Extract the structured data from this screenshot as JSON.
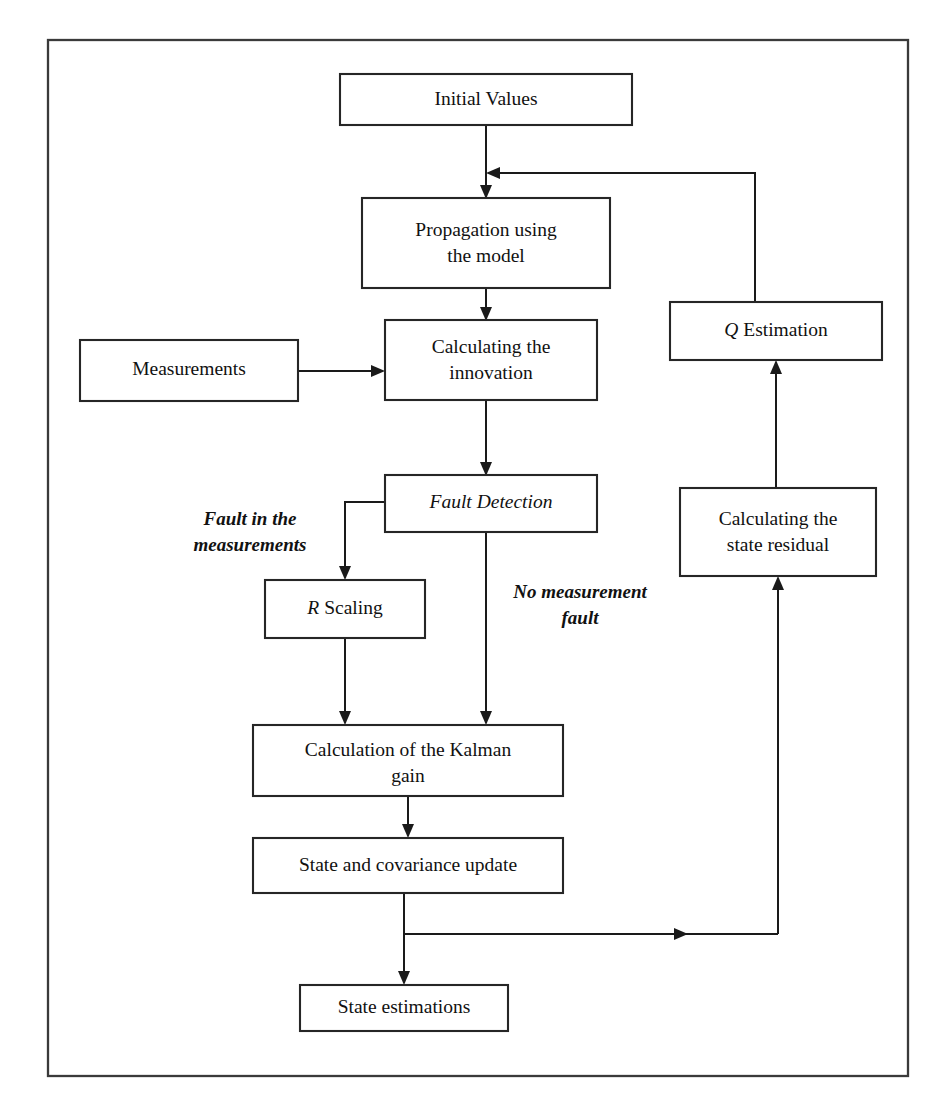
{
  "diagram": {
    "frame": {
      "x": 48,
      "y": 40,
      "width": 860,
      "height": 1036
    },
    "colors": {
      "box_stroke": "#262626",
      "box_fill": "#ffffff",
      "edge": "#1a1a1a",
      "text": "#111111",
      "frame": "#3a3a3a",
      "background": "#ffffff"
    },
    "nodes": [
      {
        "id": "initial-values",
        "label": "Initial Values",
        "lines": [
          "Initial Values"
        ],
        "x": 340,
        "y": 74,
        "width": 292,
        "height": 51
      },
      {
        "id": "propagation",
        "label": "Propagation using the model",
        "lines": [
          "Propagation using",
          "the model"
        ],
        "x": 362,
        "y": 198,
        "width": 248,
        "height": 90
      },
      {
        "id": "measurements",
        "label": "Measurements",
        "lines": [
          "Measurements"
        ],
        "x": 80,
        "y": 340,
        "width": 218,
        "height": 61
      },
      {
        "id": "calculating-innovation",
        "label": "Calculating the innovation",
        "lines": [
          "Calculating the",
          "innovation"
        ],
        "x": 385,
        "y": 320,
        "width": 212,
        "height": 80
      },
      {
        "id": "fault-detection",
        "label": "Fault Detection",
        "lines": [
          "Fault Detection"
        ],
        "italic": true,
        "x": 385,
        "y": 475,
        "width": 212,
        "height": 57
      },
      {
        "id": "r-scaling",
        "label": "R Scaling",
        "lines": [
          "R Scaling"
        ],
        "italic_lead": "R",
        "x": 265,
        "y": 580,
        "width": 160,
        "height": 58
      },
      {
        "id": "kalman-gain",
        "label": "Calculation of the Kalman gain",
        "lines": [
          "Calculation of the Kalman",
          "gain"
        ],
        "x": 253,
        "y": 725,
        "width": 310,
        "height": 71
      },
      {
        "id": "state-covariance-update",
        "label": "State and covariance update",
        "lines": [
          "State and covariance update"
        ],
        "x": 253,
        "y": 838,
        "width": 310,
        "height": 55
      },
      {
        "id": "state-estimations",
        "label": "State estimations",
        "lines": [
          "State estimations"
        ],
        "x": 300,
        "y": 985,
        "width": 208,
        "height": 46
      },
      {
        "id": "q-estimation",
        "label": "Q Estimation",
        "lines": [
          "Q Estimation"
        ],
        "italic_lead": "Q",
        "x": 670,
        "y": 302,
        "width": 212,
        "height": 58
      },
      {
        "id": "calculating-state-residual",
        "label": "Calculating the state residual",
        "lines": [
          "Calculating the",
          "state residual"
        ],
        "x": 680,
        "y": 488,
        "width": 196,
        "height": 88
      }
    ],
    "edge_labels": [
      {
        "id": "fault-in-measurements",
        "lines": [
          "Fault in the",
          "measurements"
        ],
        "x": 250,
        "y": 518
      },
      {
        "id": "no-measurement-fault",
        "lines": [
          "No measurement",
          "fault"
        ],
        "x": 580,
        "y": 592
      }
    ],
    "edges": [
      {
        "id": "initial-to-propagation",
        "from": "initial-values",
        "to": "propagation"
      },
      {
        "id": "propagation-to-innovation",
        "from": "propagation",
        "to": "calculating-innovation"
      },
      {
        "id": "measurements-to-innovation",
        "from": "measurements",
        "to": "calculating-innovation"
      },
      {
        "id": "innovation-to-fault-detection",
        "from": "calculating-innovation",
        "to": "fault-detection"
      },
      {
        "id": "fault-detection-to-r-scaling",
        "from": "fault-detection",
        "to": "r-scaling",
        "label": "Fault in the measurements"
      },
      {
        "id": "fault-detection-to-kalman-gain",
        "from": "fault-detection",
        "to": "kalman-gain",
        "label": "No measurement fault"
      },
      {
        "id": "r-scaling-to-kalman-gain",
        "from": "r-scaling",
        "to": "kalman-gain"
      },
      {
        "id": "kalman-gain-to-update",
        "from": "kalman-gain",
        "to": "state-covariance-update"
      },
      {
        "id": "update-to-state-estimations",
        "from": "state-covariance-update",
        "to": "state-estimations"
      },
      {
        "id": "update-to-state-residual",
        "from": "state-covariance-update",
        "to": "calculating-state-residual"
      },
      {
        "id": "state-residual-to-q-estimation",
        "from": "calculating-state-residual",
        "to": "q-estimation"
      },
      {
        "id": "q-estimation-to-propagation",
        "from": "q-estimation",
        "to": "propagation"
      }
    ]
  }
}
